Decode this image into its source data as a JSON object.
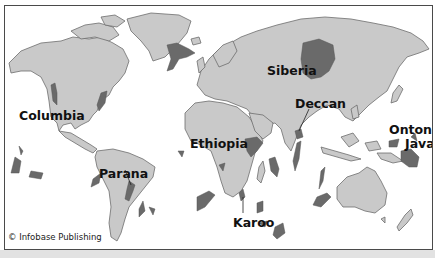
{
  "map": {
    "title": "Large igneous provinces (flood basalts) of the world",
    "colors": {
      "ocean": "#ffffff",
      "land": "#c9c9c9",
      "coast": "#6d6d6d",
      "province": "#6a6a6a",
      "frame": "#4a4a4a",
      "band": "#e2e2e2"
    },
    "labels": [
      {
        "id": "columbia",
        "text": "Columbia"
      },
      {
        "id": "siberia",
        "text": "Siberia"
      },
      {
        "id": "deccan",
        "text": "Deccan"
      },
      {
        "id": "ethiopia",
        "text": "Ethiopia"
      },
      {
        "id": "ontong",
        "text": "Ontong"
      },
      {
        "id": "java",
        "text": "Java"
      },
      {
        "id": "parana",
        "text": "Parana"
      },
      {
        "id": "karoo",
        "text": "Karoo"
      }
    ],
    "credit": "© Infobase Publishing"
  }
}
